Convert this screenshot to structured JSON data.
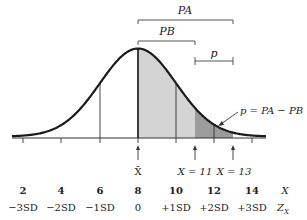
{
  "diagram": {
    "type": "normal-distribution",
    "mean_label": "X̄",
    "brackets": {
      "pa": "PA",
      "pb": "PB",
      "p": "p"
    },
    "annotation": "p = PA − PB",
    "markers": [
      {
        "label": "X = 11",
        "x_value": 11
      },
      {
        "label": "X = 13",
        "x_value": 13
      }
    ],
    "x_axis": {
      "row_label": "X",
      "ticks": [
        "2",
        "4",
        "6",
        "8",
        "10",
        "12",
        "14"
      ]
    },
    "z_axis": {
      "row_label": "Z",
      "row_label_sub": "X",
      "ticks": [
        "−3SD",
        "−2SD",
        "−1SD",
        "0",
        "+1SD",
        "+2SD",
        "+3SD"
      ]
    },
    "colors": {
      "curve": "#1a1a1a",
      "light_shade": "#d4d4d4",
      "dark_shade": "#9c9c9c",
      "bracket": "#555555"
    }
  }
}
